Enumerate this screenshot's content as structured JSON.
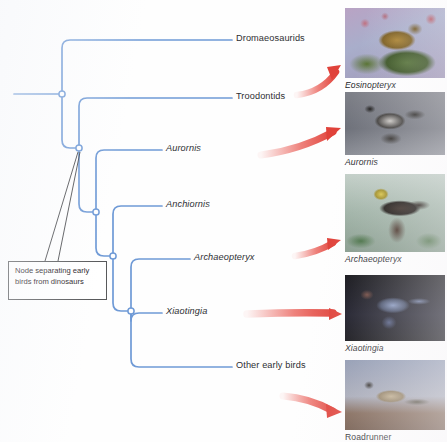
{
  "diagram": {
    "line_color": "#6f9ad6",
    "node_fill": "#ffffff",
    "arrow_color": "#e8524a",
    "text_color": "#2e2f33"
  },
  "callout": {
    "text": "Node separating early birds from dinosaurs"
  },
  "tips": [
    {
      "id": "dromaeosaurids",
      "label": "Dromaeosaurids",
      "italic": false,
      "x": 236,
      "y": 39
    },
    {
      "id": "troodontids",
      "label": "Troodontids",
      "italic": false,
      "x": 236,
      "y": 97
    },
    {
      "id": "aurornis",
      "label": "Aurornis",
      "italic": true,
      "x": 166,
      "y": 149
    },
    {
      "id": "anchiornis",
      "label": "Anchiornis",
      "italic": true,
      "x": 166,
      "y": 205
    },
    {
      "id": "archaeopteryx",
      "label": "Archaeopteryx",
      "italic": true,
      "x": 194,
      "y": 258
    },
    {
      "id": "xiaotingia",
      "label": "Xiaotingia",
      "italic": true,
      "x": 166,
      "y": 312
    },
    {
      "id": "other-early-birds",
      "label": "Other early birds",
      "italic": false,
      "x": 236,
      "y": 366
    }
  ],
  "photos": [
    {
      "id": "eosinopteryx",
      "caption": "Eosinopteryx",
      "caption_italic": true,
      "x": 345,
      "y": 8,
      "art": "p-eosinopteryx",
      "arrow": {
        "x1": 297,
        "y1": 92,
        "x2": 340,
        "y2": 68,
        "curve": -10
      }
    },
    {
      "id": "aurornis",
      "caption": "Aurornis",
      "caption_italic": true,
      "x": 345,
      "y": 92,
      "art": "p-aurornis",
      "arrow": {
        "x1": 262,
        "y1": 152,
        "x2": 340,
        "y2": 129,
        "curve": -11
      }
    },
    {
      "id": "archaeopteryx",
      "caption": "Archaeopteryx",
      "caption_italic": true,
      "x": 345,
      "y": 174,
      "art": "p-archaeopteryx",
      "arrow": {
        "x1": 295,
        "y1": 253,
        "x2": 340,
        "y2": 238,
        "curve": -7
      }
    },
    {
      "id": "xiaotingia",
      "caption": "Xiaotingia",
      "caption_italic": true,
      "x": 345,
      "y": 275,
      "art": "p-xiaotingia",
      "arrow": {
        "x1": 248,
        "y1": 314,
        "x2": 340,
        "y2": 313,
        "curve": -2
      }
    },
    {
      "id": "roadrunner",
      "caption": "Roadrunner",
      "caption_italic": false,
      "x": 345,
      "y": 360,
      "art": "p-roadrunner",
      "arrow": {
        "x1": 283,
        "y1": 396,
        "x2": 340,
        "y2": 412,
        "curve": -8
      }
    }
  ],
  "nodes": [
    {
      "id": "root-node",
      "x": 62,
      "y": 94
    },
    {
      "id": "birds-dinosaurs-node",
      "x": 79,
      "y": 148
    },
    {
      "id": "node-anchiornis-clade",
      "x": 96,
      "y": 212
    },
    {
      "id": "node-archaeopteryx-clade",
      "x": 113,
      "y": 256
    },
    {
      "id": "node-xiaotingia-clade",
      "x": 131,
      "y": 311
    }
  ]
}
